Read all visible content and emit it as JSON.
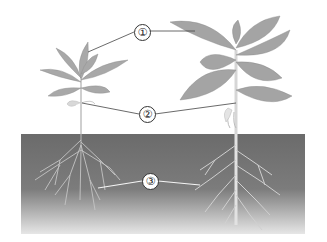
{
  "diagram": {
    "labels": [
      {
        "id": "1",
        "text": "①",
        "points_to": "leaves"
      },
      {
        "id": "2",
        "text": "②",
        "points_to": "stems"
      },
      {
        "id": "3",
        "text": "③",
        "points_to": "roots"
      }
    ],
    "plants": [
      {
        "name": "left-plant",
        "root_type": "fibrous"
      },
      {
        "name": "right-plant",
        "root_type": "taproot"
      }
    ],
    "colors": {
      "soil_top": "#6e6e6e",
      "soil_bottom": "#d9d9d9",
      "leaf": "#a9a9a9",
      "leaf_vein": "#e0e0e0",
      "stem": "#d4d4d4",
      "root": "#c8c8c8",
      "leader_line": "#444444"
    }
  }
}
